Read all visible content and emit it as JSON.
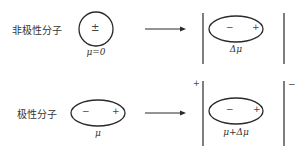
{
  "diagram": {
    "type": "molecular polarization under electric field",
    "rows": [
      {
        "label": "非极性分子",
        "molecule": {
          "shape": "circle",
          "charge_sign": "±",
          "moment_label": "μ=0"
        },
        "arrow": "right",
        "field_molecule": {
          "shape": "ellipse",
          "left_sign": "−",
          "right_sign": "+",
          "moment_label": "Δμ"
        },
        "plate_signs": {
          "left": "",
          "right": ""
        }
      },
      {
        "label": "极性分子",
        "molecule": {
          "shape": "ellipse",
          "left_sign": "−",
          "right_sign": "+",
          "moment_label": "μ"
        },
        "arrow": "right",
        "field_molecule": {
          "shape": "ellipse",
          "left_sign": "−",
          "right_sign": "+",
          "moment_label": "μ+Δμ"
        },
        "plate_signs": {
          "left": "+",
          "right": "−"
        }
      }
    ],
    "colors": {
      "stroke": "#2a2a2a",
      "background": "#ffffff"
    }
  }
}
